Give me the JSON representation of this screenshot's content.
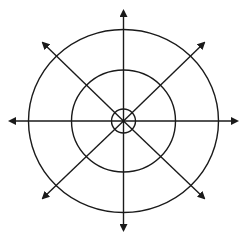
{
  "diagram": {
    "stroke_color": "#1a1a1a",
    "background": "#ffffff",
    "center": {
      "x": 123.5,
      "y": 121
    },
    "circles": [
      {
        "name": "inner",
        "rx": 12,
        "ry": 12
      },
      {
        "name": "middle",
        "rx": 52,
        "ry": 51
      },
      {
        "name": "outer",
        "rx": 95,
        "ry": 91.5
      }
    ],
    "arrows": [
      {
        "direction": "up",
        "x": 123.5,
        "y": 11
      },
      {
        "direction": "up-right",
        "x": 204,
        "y": 43
      },
      {
        "direction": "right",
        "x": 237,
        "y": 121
      },
      {
        "direction": "down-right",
        "x": 204,
        "y": 198
      },
      {
        "direction": "down",
        "x": 123.5,
        "y": 230
      },
      {
        "direction": "down-left",
        "x": 43,
        "y": 198
      },
      {
        "direction": "left",
        "x": 10,
        "y": 121
      },
      {
        "direction": "up-left",
        "x": 43,
        "y": 43
      }
    ]
  }
}
